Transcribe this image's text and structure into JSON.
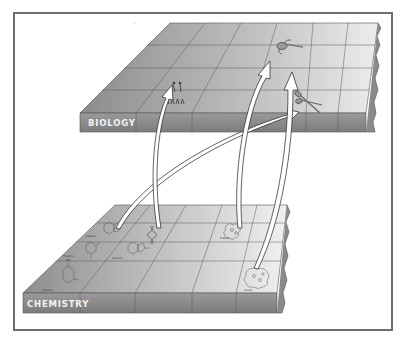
{
  "diagram": {
    "type": "layered-knowledge-mapping",
    "layers": [
      {
        "id": "biology",
        "label": "BIOLOGY",
        "items": [
          {
            "name": "organisms-figures",
            "caption": ""
          },
          {
            "name": "flagella-molecule",
            "caption": ""
          },
          {
            "name": "scissors-protein",
            "caption": ""
          }
        ]
      },
      {
        "id": "chemistry",
        "label": "CHEMISTRY",
        "items": [
          {
            "name": "adenine",
            "caption": "Adenine"
          },
          {
            "name": "dna-helix",
            "caption": ""
          },
          {
            "name": "thymine",
            "caption": "Thymine"
          },
          {
            "name": "guanine",
            "caption": "Guanine"
          },
          {
            "name": "cytosine",
            "caption": "Cytosine"
          },
          {
            "name": "protein",
            "caption": "Protein"
          },
          {
            "name": "insulin",
            "caption": "Insulin"
          }
        ]
      }
    ],
    "arrows": [
      {
        "from": "dna-helix",
        "to": "organisms-figures"
      },
      {
        "from": "adenine",
        "to": "scissors-protein"
      },
      {
        "from": "protein",
        "to": "flagella-molecule"
      },
      {
        "from": "insulin",
        "to": "scissors-protein"
      }
    ]
  },
  "colors": {
    "platform_top_dark": "#8f8f8f",
    "platform_top_light": "#e6e6e6",
    "platform_front": "#8a8a8a",
    "grid_line": "#5a5a5a",
    "arrow_fill": "#ffffff",
    "arrow_stroke": "#222222",
    "frame": "#6e6e6e"
  }
}
